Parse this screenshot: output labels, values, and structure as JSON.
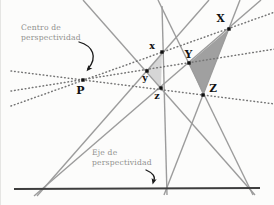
{
  "annotations": {
    "center_label": {
      "line1": "Centro de",
      "line2": "perspectividad",
      "x": 20,
      "y": 23
    },
    "axis_label": {
      "line1": "Eje de",
      "line2": "perspectividad",
      "x": 91,
      "y": 148
    }
  },
  "colors": {
    "background": "#fcfcfb",
    "solid_line": "#9c9c9c",
    "dotted_line": "#757575",
    "axis_line": "#3d3d3d",
    "marker": "#111111",
    "arrow": "#1a1a1a",
    "triangle_small_fill": "#d6d6d6",
    "triangle_large_fill": "#a0a0a0",
    "annotation_text": "#8f8f8d"
  },
  "diagram": {
    "axis_line": {
      "name": "axis-of-perspectivity-line",
      "x1": 13,
      "y1": 189,
      "x2": 259,
      "y2": 188
    },
    "triangles": [
      {
        "name": "triangle-xyz",
        "points": "161,52 146,71 160,88",
        "fill_key": "triangle_small_fill"
      },
      {
        "name": "triangle-XYZ",
        "points": "228,29 188,63 202,95",
        "fill_key": "triangle_large_fill"
      }
    ],
    "solid_lines": [
      {
        "name": "side-line-xy",
        "x1": 208,
        "y1": 0,
        "x2": 36,
        "y2": 196
      },
      {
        "name": "side-line-XY",
        "x1": 260,
        "y1": 0,
        "x2": 33,
        "y2": 196
      },
      {
        "name": "side-line-xz",
        "x1": 161,
        "y1": 6,
        "x2": 166,
        "y2": 195
      },
      {
        "name": "side-line-XZ",
        "x1": 239,
        "y1": 0,
        "x2": 163,
        "y2": 195
      },
      {
        "name": "side-line-yz",
        "x1": 82,
        "y1": 0,
        "x2": 254,
        "y2": 195
      },
      {
        "name": "side-line-YZ",
        "x1": 157,
        "y1": 0,
        "x2": 252,
        "y2": 195
      }
    ],
    "dotted_lines": [
      {
        "name": "perspectivity-ray-x",
        "x1": 10,
        "y1": 106,
        "x2": 274,
        "y2": 12
      },
      {
        "name": "perspectivity-ray-y",
        "x1": 10,
        "y1": 91,
        "x2": 274,
        "y2": 49
      },
      {
        "name": "perspectivity-ray-z",
        "x1": 10,
        "y1": 71,
        "x2": 274,
        "y2": 104
      }
    ],
    "points": [
      {
        "label": "P",
        "x": 82,
        "y": 80,
        "lx": 79.5,
        "ly": 94,
        "size": 11
      },
      {
        "label": "x",
        "x": 161,
        "y": 52,
        "lx": 151,
        "ly": 49,
        "size": 9.5
      },
      {
        "label": "y",
        "x": 146,
        "y": 71,
        "lx": 144,
        "ly": 81,
        "size": 9.5
      },
      {
        "label": "z",
        "x": 160,
        "y": 88,
        "lx": 156,
        "ly": 99,
        "size": 9.5
      },
      {
        "label": "X",
        "x": 228,
        "y": 29,
        "lx": 219.5,
        "ly": 22,
        "size": 10.5
      },
      {
        "label": "Y",
        "x": 188,
        "y": 63,
        "lx": 187.5,
        "ly": 58,
        "size": 10.5
      },
      {
        "label": "Z",
        "x": 202,
        "y": 95,
        "lx": 212,
        "ly": 92,
        "size": 10.5
      }
    ],
    "arrows": [
      {
        "name": "center-label-arrow",
        "path": "M 78,42 C 92,46 97,57 87,69",
        "tip": [
          86.5,
          70
        ],
        "angle": 130
      },
      {
        "name": "axis-label-arrow",
        "path": "M 145,170 C 152,173 155,177 152.5,181",
        "tip": [
          152,
          183
        ],
        "angle": 105
      }
    ]
  }
}
